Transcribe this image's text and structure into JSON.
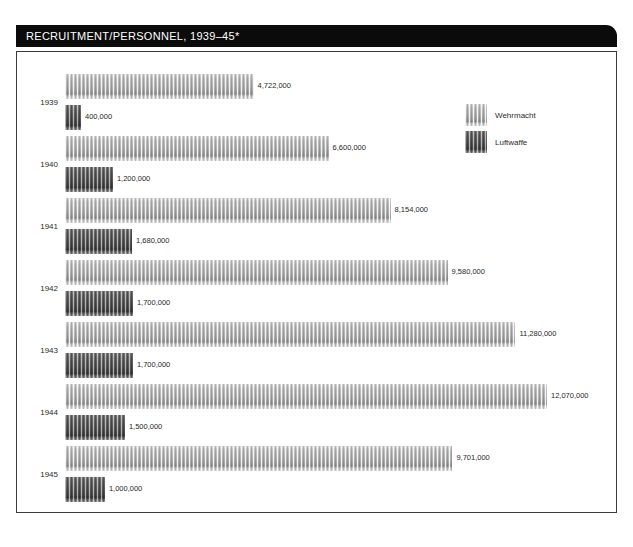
{
  "header": {
    "title": "RECRUITMENT/PERSONNEL, 1939–45*"
  },
  "legend": {
    "items": [
      {
        "label": "Wehrmacht",
        "color": "#b0b0b0",
        "key": "wehrmacht"
      },
      {
        "label": "Luftwaffe",
        "color": "#555555",
        "key": "luftwaffe"
      }
    ]
  },
  "chart_data": {
    "type": "bar",
    "orientation": "horizontal",
    "title": "RECRUITMENT/PERSONNEL, 1939–45*",
    "xlabel": "",
    "ylabel": "",
    "categories": [
      "1939",
      "1940",
      "1941",
      "1942",
      "1943",
      "1944",
      "1945"
    ],
    "legend_position": "top-right",
    "grid": false,
    "xlim": [
      0,
      12070000
    ],
    "series": [
      {
        "name": "Wehrmacht",
        "color": "#b0b0b0",
        "values": [
          4722000,
          6600000,
          8154000,
          9580000,
          11280000,
          12070000,
          9701000
        ],
        "labels": [
          "4,722,000",
          "6,600,000",
          "8,154,000",
          "9,580,000",
          "11,280,000",
          "12,070,000",
          "9,701,000"
        ]
      },
      {
        "name": "Luftwaffe",
        "color": "#555555",
        "values": [
          400000,
          1200000,
          1680000,
          1700000,
          1700000,
          1500000,
          1000000
        ],
        "labels": [
          "400,000",
          "1,200,000",
          "1,680,000",
          "1,700,000",
          "1,700,000",
          "1,500,000",
          "1,000,000"
        ]
      }
    ]
  }
}
